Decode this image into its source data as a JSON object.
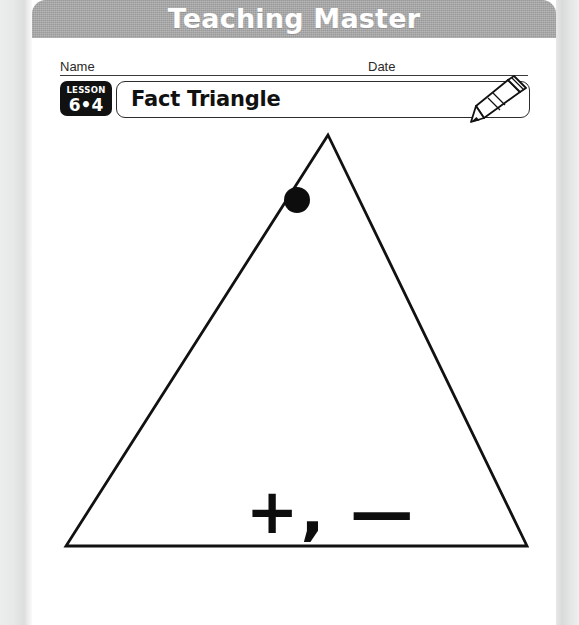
{
  "banner": {
    "title": "Teaching Master",
    "bg_color": "#a8a8a8",
    "text_color": "#ffffff"
  },
  "header": {
    "name_label": "Name",
    "date_label": "Date",
    "lesson": {
      "word": "LESSON",
      "number": "6•4",
      "bg_color": "#111111",
      "text_color": "#ffffff"
    },
    "title": "Fact Triangle",
    "pencil_icon": "pencil-icon"
  },
  "worksheet": {
    "operators": "+, —",
    "dot_marker": "filled-circle-dot",
    "triangle": {
      "apex_x": 296,
      "apex_y": 10,
      "left_x": 34,
      "left_y": 421,
      "right_x": 495,
      "right_y": 421,
      "stroke_color": "#111111",
      "stroke_width": 2.8
    },
    "dot": {
      "cx": 265,
      "cy": 75,
      "r": 13,
      "color": "#0d0d0d"
    }
  }
}
